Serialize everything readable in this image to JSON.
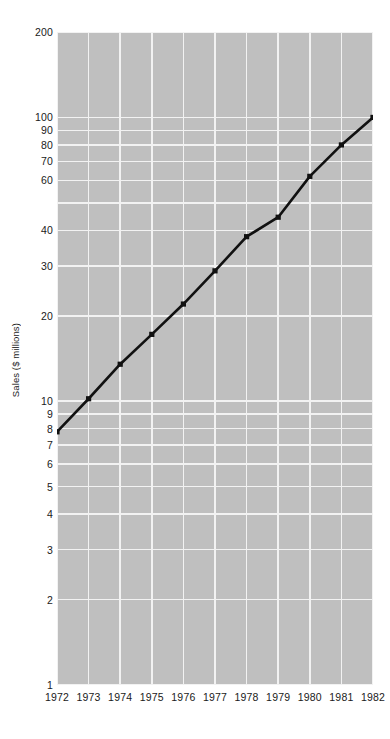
{
  "chart_data": {
    "type": "line",
    "title": "",
    "xlabel": "",
    "ylabel": "Sales ($ millions)",
    "yscale": "log",
    "ylim": [
      1,
      200
    ],
    "xlim": [
      1972,
      1982
    ],
    "grid": true,
    "legend": null,
    "marker": "square",
    "line_color": "#111111",
    "plot_background": "#bfbfbf",
    "gridline_color": "#f2f2f2",
    "categories": [
      1972,
      1973,
      1974,
      1975,
      1976,
      1977,
      1978,
      1979,
      1980,
      1981,
      1982
    ],
    "x": [
      "1972",
      "1973",
      "1974",
      "1975",
      "1976",
      "1977",
      "1978",
      "1979",
      "1980",
      "1981",
      "1982"
    ],
    "values": [
      7.8,
      10.2,
      13.5,
      17.2,
      22.0,
      28.8,
      38.0,
      44.5,
      62.0,
      80.0,
      100.0
    ],
    "series": [
      {
        "name": "Sales",
        "values": [
          7.8,
          10.2,
          13.5,
          17.2,
          22.0,
          28.8,
          38.0,
          44.5,
          62.0,
          80.0,
          100.0
        ]
      }
    ],
    "y_tick_labels": [
      "200",
      "100",
      "90",
      "80",
      "70",
      "60",
      "40",
      "30",
      "20",
      "10",
      "9",
      "8",
      "7",
      "6",
      "5",
      "4",
      "3",
      "2",
      "1"
    ],
    "y_tick_values": [
      200,
      100,
      90,
      80,
      70,
      60,
      40,
      30,
      20,
      10,
      9,
      8,
      7,
      6,
      5,
      4,
      3,
      2,
      1
    ],
    "x_tick_labels": [
      "1972",
      "1973",
      "1974",
      "1975",
      "1976",
      "1977",
      "1978",
      "1979",
      "1980",
      "1981",
      "1982"
    ],
    "gridlines_y": [
      200,
      100,
      90,
      80,
      70,
      60,
      50,
      40,
      30,
      20,
      10,
      9,
      8,
      7,
      6,
      5,
      4,
      3,
      2,
      1
    ]
  }
}
